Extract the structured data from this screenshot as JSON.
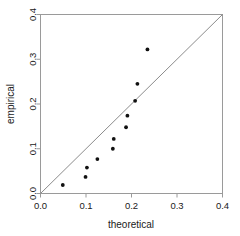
{
  "chart_data": {
    "type": "scatter",
    "title": "",
    "xlabel": "theoretical",
    "ylabel": "empirical",
    "xlim": [
      0.0,
      0.4
    ],
    "ylim": [
      0.0,
      0.4
    ],
    "xticks": [
      0.0,
      0.1,
      0.2,
      0.3,
      0.4
    ],
    "yticks": [
      0.0,
      0.1,
      0.2,
      0.3,
      0.4
    ],
    "xticklabels": [
      "0.0",
      "0.1",
      "0.2",
      "0.3",
      "0.4"
    ],
    "yticklabels": [
      "0.0",
      "0.1",
      "0.2",
      "0.3",
      "0.4"
    ],
    "grid": false,
    "legend": false,
    "series": [
      {
        "name": "quantiles",
        "marker": "filled-circle",
        "color": "#111111",
        "x": [
          0.049,
          0.099,
          0.102,
          0.125,
          0.159,
          0.161,
          0.188,
          0.191,
          0.208,
          0.213,
          0.235
        ],
        "y": [
          0.019,
          0.037,
          0.058,
          0.077,
          0.1,
          0.122,
          0.148,
          0.174,
          0.207,
          0.245,
          0.322
        ]
      }
    ],
    "reference_line": {
      "name": "identity-line",
      "color": "#8c8c8c",
      "x": [
        0.0,
        0.4
      ],
      "y": [
        0.0,
        0.4
      ]
    }
  }
}
